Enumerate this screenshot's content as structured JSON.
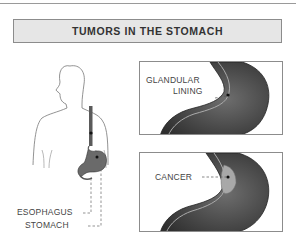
{
  "title": "TUMORS IN THE STOMACH",
  "labels": {
    "esophagus": "ESOPHAGUS",
    "stomach": "STOMACH",
    "glandular_line1": "GLANDULAR",
    "glandular_line2": "LINING",
    "cancer": "CANCER"
  },
  "colors": {
    "title_bg": "#e6e6e6",
    "border": "#8c8c8c",
    "stomach_dark": "#3a3a3a",
    "stomach_mid": "#6e6e6e",
    "tumor": "#a8a8a8",
    "text": "#444444"
  }
}
